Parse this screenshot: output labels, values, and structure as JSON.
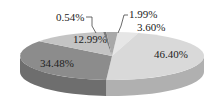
{
  "chart_data": {
    "type": "pie",
    "style": "3d-exploded-none",
    "title": "",
    "slices": [
      {
        "label": "46.40%",
        "value": 46.4,
        "color": "#d9d9d9",
        "side": "#b0b0b0"
      },
      {
        "label": "34.48%",
        "value": 34.48,
        "color": "#8c8c8c",
        "side": "#6e6e6e"
      },
      {
        "label": "12.99%",
        "value": 12.99,
        "color": "#c4c4c4",
        "side": "#9a9a9a"
      },
      {
        "label": "0.54%",
        "value": 0.54,
        "color": "#7a7a7a",
        "side": "#5c5c5c"
      },
      {
        "label": "1.99%",
        "value": 1.99,
        "color": "#a8a8a8",
        "side": "#888888"
      },
      {
        "label": "3.60%",
        "value": 3.6,
        "color": "#e6e6e6",
        "side": "#bdbdbd"
      }
    ],
    "legend": "none"
  }
}
